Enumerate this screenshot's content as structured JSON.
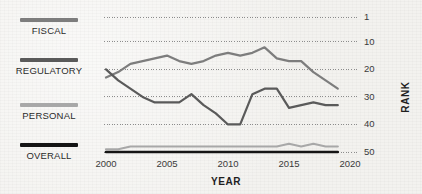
{
  "legend": {
    "items": [
      {
        "label": "FISCAL",
        "color": "#7d7d7d",
        "swatch_name": "legend-swatch-fiscal"
      },
      {
        "label": "REGULATORY",
        "color": "#5a5a5a",
        "swatch_name": "legend-swatch-regulatory"
      },
      {
        "label": "PERSONAL",
        "color": "#a8a8a8",
        "swatch_name": "legend-swatch-personal"
      },
      {
        "label": "OVERALL",
        "color": "#151515",
        "swatch_name": "legend-swatch-overall"
      }
    ]
  },
  "chart_data": {
    "type": "line",
    "title": "",
    "xlabel": "YEAR",
    "ylabel": "RANK",
    "x": [
      2000,
      2001,
      2002,
      2003,
      2004,
      2005,
      2006,
      2007,
      2008,
      2009,
      2010,
      2011,
      2012,
      2013,
      2014,
      2015,
      2016,
      2017,
      2018,
      2019
    ],
    "xlim": [
      2000,
      2020
    ],
    "xticks": [
      2000,
      2005,
      2010,
      2015,
      2020
    ],
    "xtick_labels": [
      "2000",
      "2005",
      "2010",
      "2015",
      "2020"
    ],
    "ylim": [
      1,
      52
    ],
    "y_inverted": true,
    "yticks": [
      1,
      10,
      20,
      30,
      40,
      50
    ],
    "ytick_labels": [
      "1",
      "10",
      "20",
      "30",
      "40",
      "50"
    ],
    "grid": "horizontal-dotted",
    "legend_position": "left",
    "series": [
      {
        "name": "FISCAL",
        "color": "#7d7d7d",
        "values": [
          23,
          21,
          18,
          17,
          16,
          15,
          17,
          18,
          17,
          15,
          14,
          15,
          14,
          12,
          16,
          17,
          17,
          21,
          24,
          27
        ]
      },
      {
        "name": "REGULATORY",
        "color": "#5a5a5a",
        "values": [
          20,
          24,
          27,
          30,
          32,
          32,
          32,
          29,
          33,
          36,
          40,
          40,
          29,
          27,
          27,
          34,
          33,
          32,
          33,
          33
        ]
      },
      {
        "name": "PERSONAL",
        "color": "#a8a8a8",
        "values": [
          49,
          49,
          48,
          48,
          48,
          48,
          48,
          48,
          48,
          48,
          48,
          48,
          48,
          48,
          48,
          47,
          48,
          47,
          48,
          48
        ]
      },
      {
        "name": "OVERALL",
        "color": "#151515",
        "values": [
          50,
          50,
          50,
          50,
          50,
          50,
          50,
          50,
          50,
          50,
          50,
          50,
          50,
          50,
          50,
          50,
          50,
          50,
          50,
          50
        ]
      }
    ]
  }
}
